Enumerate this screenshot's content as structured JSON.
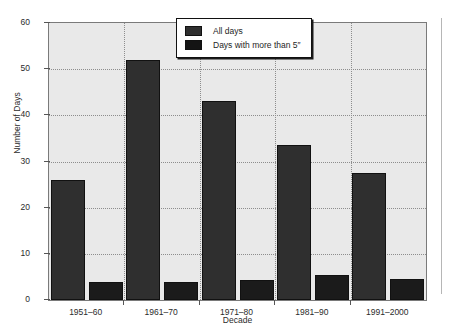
{
  "chart_data": {
    "type": "bar",
    "title": "",
    "xlabel": "Decade",
    "ylabel": "Number of Days",
    "categories": [
      "1951–60",
      "1961–70",
      "1971–80",
      "1981–90",
      "1991–2000"
    ],
    "series": [
      {
        "name": "All days",
        "values": [
          26,
          52,
          43,
          33.5,
          27.5
        ],
        "color": "#2f2f2f"
      },
      {
        "name": "Days with more than 5″",
        "values": [
          4,
          4,
          4.3,
          5.5,
          4.5
        ],
        "color": "#1b1b1b"
      }
    ],
    "ylim": [
      0,
      60
    ],
    "yticks": [
      0,
      10,
      20,
      30,
      40,
      50,
      60
    ],
    "ytick_labels": [
      "0",
      "10",
      "20",
      "30",
      "40",
      "50",
      "60"
    ],
    "grid": true,
    "grid_style": "dotted",
    "legend_position": "top-right-inside",
    "plot_background": "#e9e9e9",
    "page_background": "#ffffff"
  },
  "legend": {
    "entries": [
      {
        "label": "All days"
      },
      {
        "label": "Days with more than 5″"
      }
    ]
  }
}
